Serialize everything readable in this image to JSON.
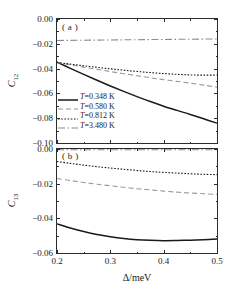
{
  "figure": {
    "panel_a_tag": "( a )",
    "panel_b_tag": "( b )",
    "xlabel": "Δ/meV"
  },
  "legend": {
    "items": [
      {
        "label": "T=0.348 K",
        "style": "solid",
        "color": "#1a1a1a"
      },
      {
        "label": "T=0.580 K",
        "style": "dashed",
        "color": "#9a9a9a"
      },
      {
        "label": "T=0.812 K",
        "style": "dotted",
        "color": "#1a1a1a"
      },
      {
        "label": "T=3.480 K",
        "style": "dashdot",
        "color": "#8c8c8c"
      }
    ]
  },
  "axes": {
    "y_a_ticks": [
      "0.00",
      "−0.02",
      "−0.04",
      "−0.06",
      "−0.08",
      "−0.10"
    ],
    "y_b_ticks": [
      "0.00",
      "−0.02",
      "−0.04",
      "−0.06"
    ],
    "x_ticks": [
      "0.2",
      "0.3",
      "0.4",
      "0.5"
    ]
  },
  "chart_data": {
    "type": "line",
    "title": "",
    "xlabel": "Δ/meV",
    "xlim": [
      0.2,
      0.5
    ],
    "x_ticks": [
      0.2,
      0.3,
      0.4,
      0.5
    ],
    "grid": false,
    "legend_position": "lower-left of panel (a)",
    "panels": [
      {
        "tag": "( a )",
        "ylabel": "C12",
        "ylim": [
          -0.1,
          0.0
        ],
        "y_ticks": [
          0.0,
          -0.02,
          -0.04,
          -0.06,
          -0.08,
          -0.1
        ],
        "x": [
          0.2,
          0.225,
          0.25,
          0.275,
          0.3,
          0.325,
          0.35,
          0.375,
          0.4,
          0.425,
          0.45,
          0.475,
          0.5
        ],
        "series": [
          {
            "name": "T=0.348 K",
            "style": "solid",
            "color": "#1a1a1a",
            "values": [
              -0.0348,
              -0.0398,
              -0.0447,
              -0.0494,
              -0.054,
              -0.0584,
              -0.0626,
              -0.0666,
              -0.0703,
              -0.0737,
              -0.077,
              -0.0805,
              -0.084
            ]
          },
          {
            "name": "T=0.580 K",
            "style": "dashed",
            "color": "#9a9a9a",
            "values": [
              -0.035,
              -0.0369,
              -0.0388,
              -0.0406,
              -0.0424,
              -0.0441,
              -0.0458,
              -0.0474,
              -0.0489,
              -0.0503,
              -0.0517,
              -0.0533,
              -0.055
            ]
          },
          {
            "name": "T=0.812 K",
            "style": "dotted",
            "color": "#1a1a1a",
            "values": [
              -0.035,
              -0.0364,
              -0.0377,
              -0.039,
              -0.0402,
              -0.0413,
              -0.0423,
              -0.0432,
              -0.044,
              -0.0446,
              -0.0451,
              -0.0453,
              -0.0452
            ]
          },
          {
            "name": "T=3.480 K",
            "style": "dashdot",
            "color": "#8c8c8c",
            "values": [
              -0.0173,
              -0.0172,
              -0.0171,
              -0.017,
              -0.0169,
              -0.0168,
              -0.0167,
              -0.0166,
              -0.0165,
              -0.0164,
              -0.0163,
              -0.0162,
              -0.0161
            ]
          }
        ]
      },
      {
        "tag": "( b )",
        "ylabel": "C13",
        "ylim": [
          -0.06,
          0.0
        ],
        "y_ticks": [
          0.0,
          -0.02,
          -0.04,
          -0.06
        ],
        "x": [
          0.2,
          0.225,
          0.25,
          0.275,
          0.3,
          0.325,
          0.35,
          0.375,
          0.4,
          0.425,
          0.45,
          0.475,
          0.5
        ],
        "series": [
          {
            "name": "T=0.348 K",
            "style": "solid",
            "color": "#1a1a1a",
            "values": [
              -0.0432,
              -0.0456,
              -0.0476,
              -0.0493,
              -0.0506,
              -0.0516,
              -0.0523,
              -0.0527,
              -0.0529,
              -0.0528,
              -0.0526,
              -0.0523,
              -0.0519
            ]
          },
          {
            "name": "T=0.580 K",
            "style": "dashed",
            "color": "#9a9a9a",
            "values": [
              -0.017,
              -0.0182,
              -0.0193,
              -0.0203,
              -0.0212,
              -0.0221,
              -0.0229,
              -0.0236,
              -0.0243,
              -0.0249,
              -0.0254,
              -0.0258,
              -0.0262
            ]
          },
          {
            "name": "T=0.812 K",
            "style": "dotted",
            "color": "#1a1a1a",
            "values": [
              -0.0072,
              -0.0083,
              -0.0093,
              -0.0102,
              -0.011,
              -0.0117,
              -0.0124,
              -0.013,
              -0.0135,
              -0.0139,
              -0.0143,
              -0.0146,
              -0.0148
            ]
          },
          {
            "name": "T=3.480 K",
            "style": "dashdot",
            "color": "#8c8c8c",
            "values": [
              -0.0004,
              -0.0004,
              -0.0004,
              -0.0004,
              -0.0004,
              -0.0004,
              -0.0004,
              -0.0004,
              -0.0004,
              -0.0004,
              -0.0004,
              -0.0004,
              -0.0004
            ]
          }
        ]
      }
    ]
  }
}
